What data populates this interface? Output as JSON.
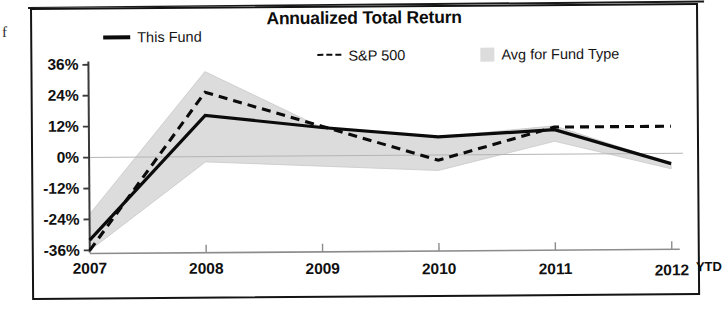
{
  "artifacts": {
    "stray_char": "f"
  },
  "chart": {
    "title": "Annualized Total Return",
    "legend": [
      {
        "key": "this_fund",
        "label": "This Fund",
        "marker": "solid-line",
        "color": "#0b0b0b"
      },
      {
        "key": "sp500",
        "label": "S&P 500",
        "marker": "dashed-line",
        "color": "#0b0b0b"
      },
      {
        "key": "avg_fund_type",
        "label": "Avg for Fund Type",
        "marker": "filled-swatch",
        "color": "#dcdcdc"
      }
    ],
    "x_axis_suffix": "YTD"
  },
  "chart_data": {
    "type": "line",
    "title": "Annualized Total Return",
    "xlabel": "",
    "ylabel": "",
    "categories": [
      "2007",
      "2008",
      "2009",
      "2010",
      "2011",
      "2012"
    ],
    "x_tick_labels": [
      "2007",
      "2008",
      "2009",
      "2010",
      "2011",
      "2012"
    ],
    "y_tick_labels": [
      "36%",
      "24%",
      "12%",
      "0%",
      "-12%",
      "-24%",
      "-36%"
    ],
    "y_ticks": [
      36,
      24,
      12,
      0,
      -12,
      -24,
      -36
    ],
    "ylim": [
      -38,
      38
    ],
    "grid": false,
    "legend_position": "top",
    "zero_line": 0,
    "last_point_note": "YTD",
    "series": [
      {
        "name": "This Fund",
        "style": "solid",
        "color": "#0b0b0b",
        "values": [
          -32,
          16,
          11,
          7,
          9.5,
          -4
        ]
      },
      {
        "name": "S&P 500",
        "style": "dashed",
        "color": "#0b0b0b",
        "values": [
          -36,
          25,
          11.5,
          -2,
          10.5,
          10.5
        ]
      }
    ],
    "band": {
      "name": "Avg for Fund Type",
      "color": "#dcdcdc",
      "upper": [
        -22,
        33,
        11,
        7,
        11,
        -4
      ],
      "lower": [
        -36,
        -2,
        -4,
        -6,
        5,
        -6
      ]
    }
  }
}
